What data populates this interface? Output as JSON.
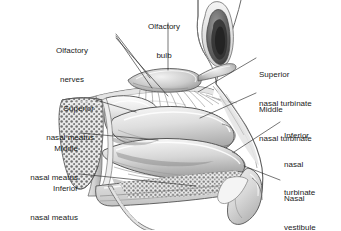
{
  "figure": {
    "type": "medical-illustration",
    "style": "grayscale pen-and-ink anatomical drawing",
    "width": 341,
    "height": 230,
    "background_color": "#ffffff",
    "ink_color": "#1b1b1b",
    "tone_colors": {
      "lightest": "#f2f2f2",
      "light": "#e2e2e2",
      "mid": "#c8c8c8",
      "mid_dark": "#a8a8a8",
      "dark": "#8a8a8a",
      "darkest": "#4a4a4a"
    }
  },
  "labels": [
    {
      "id": "olfactory-nerves",
      "lines": [
        "Olfactory",
        "nerves"
      ],
      "text": "Olfactory nerves",
      "align": "center",
      "x": 72,
      "y": 27
    },
    {
      "id": "olfactory-bulb",
      "lines": [
        "Olfactory",
        "bulb"
      ],
      "text": "Olfactory bulb",
      "align": "center",
      "x": 149,
      "y": 3
    },
    {
      "id": "superior-nasal-turbinate",
      "lines": [
        "Superior",
        "nasal turbinate"
      ],
      "text": "Superior nasal turbinate",
      "align": "left",
      "x": 259,
      "y": 52
    },
    {
      "id": "middle-nasal-turbinate",
      "lines": [
        "Middle",
        "nasal turbinate"
      ],
      "text": "Middle nasal turbinate",
      "align": "left",
      "x": 259,
      "y": 87
    },
    {
      "id": "inferior-nasal-turbinate",
      "lines": [
        "Inferior",
        "nasal",
        "turbinate"
      ],
      "text": "Inferior nasal turbinate",
      "align": "left",
      "x": 283,
      "y": 113
    },
    {
      "id": "nasal-vestibule",
      "lines": [
        "Nasal",
        "vestibule"
      ],
      "text": "Nasal vestibule",
      "align": "left",
      "x": 283,
      "y": 176
    },
    {
      "id": "superior-nasal-meatus",
      "lines": [
        "Superior",
        "nasal meatus"
      ],
      "text": "Superior nasal meatus",
      "align": "right",
      "x": 94,
      "y": 86
    },
    {
      "id": "middle-nasal-meatus",
      "lines": [
        "Middle",
        "nasal meatus"
      ],
      "text": "Middle nasal meatus",
      "align": "right",
      "x": 78,
      "y": 126
    },
    {
      "id": "inferior-nasal-meatus",
      "lines": [
        "Inferior",
        "nasal meatus"
      ],
      "text": "Inferior nasal meatus",
      "align": "right",
      "x": 78,
      "y": 166
    }
  ],
  "label_text": {
    "olfactory_nerves_1": "Olfactory",
    "olfactory_nerves_2": "nerves",
    "olfactory_bulb_1": "Olfactory",
    "olfactory_bulb_2": "bulb",
    "superior_nasal_turbinate_1": "Superior",
    "superior_nasal_turbinate_2": "nasal turbinate",
    "middle_nasal_turbinate_1": "Middle",
    "middle_nasal_turbinate_2": "nasal turbinate",
    "inferior_nasal_turbinate_1": "Inferior",
    "inferior_nasal_turbinate_2": "nasal",
    "inferior_nasal_turbinate_3": "turbinate",
    "nasal_vestibule_1": "Nasal",
    "nasal_vestibule_2": "vestibule",
    "superior_nasal_meatus_1": "Superior",
    "superior_nasal_meatus_2": "nasal meatus",
    "middle_nasal_meatus_1": "Middle",
    "middle_nasal_meatus_2": "nasal meatus",
    "inferior_nasal_meatus_1": "Inferior",
    "inferior_nasal_meatus_2": "nasal meatus"
  },
  "structures": [
    "olfactory bulb",
    "olfactory nerves (fila olfactoria)",
    "cribriform plate",
    "superior nasal turbinate",
    "middle nasal turbinate",
    "inferior nasal turbinate",
    "superior nasal meatus",
    "middle nasal meatus",
    "inferior nasal meatus",
    "sphenoid sinus (cancellous bone)",
    "hard palate",
    "nasal vestibule",
    "frontal sinus",
    "nasal dorsum",
    "soft palate"
  ]
}
